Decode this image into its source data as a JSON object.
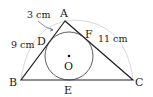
{
  "diagram": {
    "type": "geometry-incircle-triangle",
    "vertices": {
      "A": {
        "label": "A",
        "x": 65,
        "y": 21
      },
      "B": {
        "label": "B",
        "x": 21,
        "y": 80
      },
      "C": {
        "label": "C",
        "x": 133,
        "y": 80
      }
    },
    "tangent_points": {
      "D": {
        "label": "D",
        "on": "AB"
      },
      "E": {
        "label": "E",
        "on": "BC"
      },
      "F": {
        "label": "F",
        "on": "AC"
      }
    },
    "incircle": {
      "center_label": "O",
      "cx": 69,
      "cy": 56,
      "r": 24
    },
    "measurements": {
      "AD": "3 cm",
      "BD": "9 cm",
      "FC": "11 cm"
    },
    "colors": {
      "line": "#222222",
      "outer_arc": "#cccccc"
    }
  }
}
